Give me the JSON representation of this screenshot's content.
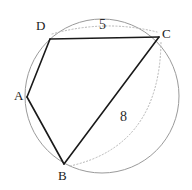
{
  "figure": {
    "width": 192,
    "height": 190,
    "background_color": "#ffffff"
  },
  "colors": {
    "circle_stroke": "#9a9a9a",
    "chord_stroke": "#1a1a1a",
    "dotted_stroke": "#b5b5b5",
    "label_color": "#1a1a1a",
    "measure_label_color": "#2a2a2a"
  },
  "circle": {
    "name": "circumscribed-circle",
    "cx": 102,
    "cy": 96,
    "r": 77,
    "stroke_width": 1
  },
  "points": [
    {
      "id": "A",
      "label": "A",
      "x": 27,
      "y": 97,
      "label_x": 14,
      "label_y": 89
    },
    {
      "id": "B",
      "label": "B",
      "x": 64,
      "y": 164,
      "label_x": 58,
      "label_y": 169
    },
    {
      "id": "C",
      "label": "C",
      "x": 159,
      "y": 37,
      "label_x": 162,
      "label_y": 27
    },
    {
      "id": "D",
      "label": "D",
      "x": 50,
      "y": 39,
      "label_x": 36,
      "label_y": 19
    }
  ],
  "segments": [
    {
      "name": "segment-DA",
      "from": "D",
      "to": "A",
      "style": "solid",
      "x1": 50,
      "y1": 39,
      "x2": 27,
      "y2": 97
    },
    {
      "name": "segment-AB",
      "from": "A",
      "to": "B",
      "style": "solid",
      "x1": 27,
      "y1": 97,
      "x2": 64,
      "y2": 164
    },
    {
      "name": "segment-DC",
      "from": "D",
      "to": "C",
      "style": "solid",
      "x1": 50,
      "y1": 39,
      "x2": 159,
      "y2": 37
    },
    {
      "name": "segment-BC",
      "from": "B",
      "to": "C",
      "style": "solid",
      "x1": 64,
      "y1": 164,
      "x2": 159,
      "y2": 37
    }
  ],
  "measure_arcs": [
    {
      "name": "measure-arc-DC",
      "path": "M 52 34 Q 105 19 157 32",
      "label": "5",
      "label_x": 99,
      "label_y": 18
    },
    {
      "name": "measure-arc-BC",
      "path": "M 70 166 Q 160 146 161 41",
      "label": "8",
      "label_x": 120,
      "label_y": 110
    }
  ],
  "measurements": [
    {
      "segment": "DC",
      "value": "5"
    },
    {
      "segment": "BC",
      "value": "8"
    }
  ]
}
